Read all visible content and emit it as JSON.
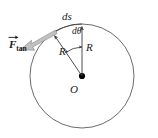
{
  "figure": {
    "type": "physics-vector-diagram",
    "labels": {
      "arc_element": "ds",
      "angle_element": "dθ",
      "radius_vertical": "R",
      "radius_diagonal": "R",
      "center": "O",
      "force_symbol": "F",
      "force_subscript": "tan"
    },
    "watermark_left": "",
    "watermark_right": "",
    "colors": {
      "circle_stroke": "#555555",
      "radius_stroke": "#3a3a3a",
      "force_fill": "#b8b8b8",
      "force_stroke": "#8a8a8a",
      "text": "#1a1a1a",
      "background": "#ffffff",
      "center_dot": "#000000"
    },
    "geometry": {
      "center_x": 82,
      "center_y": 76,
      "radius": 52,
      "radius_vertical_angle_deg": 90,
      "radius_diagonal_angle_deg": 125,
      "d_theta_deg": 35,
      "force_angle_deg": 215
    }
  }
}
